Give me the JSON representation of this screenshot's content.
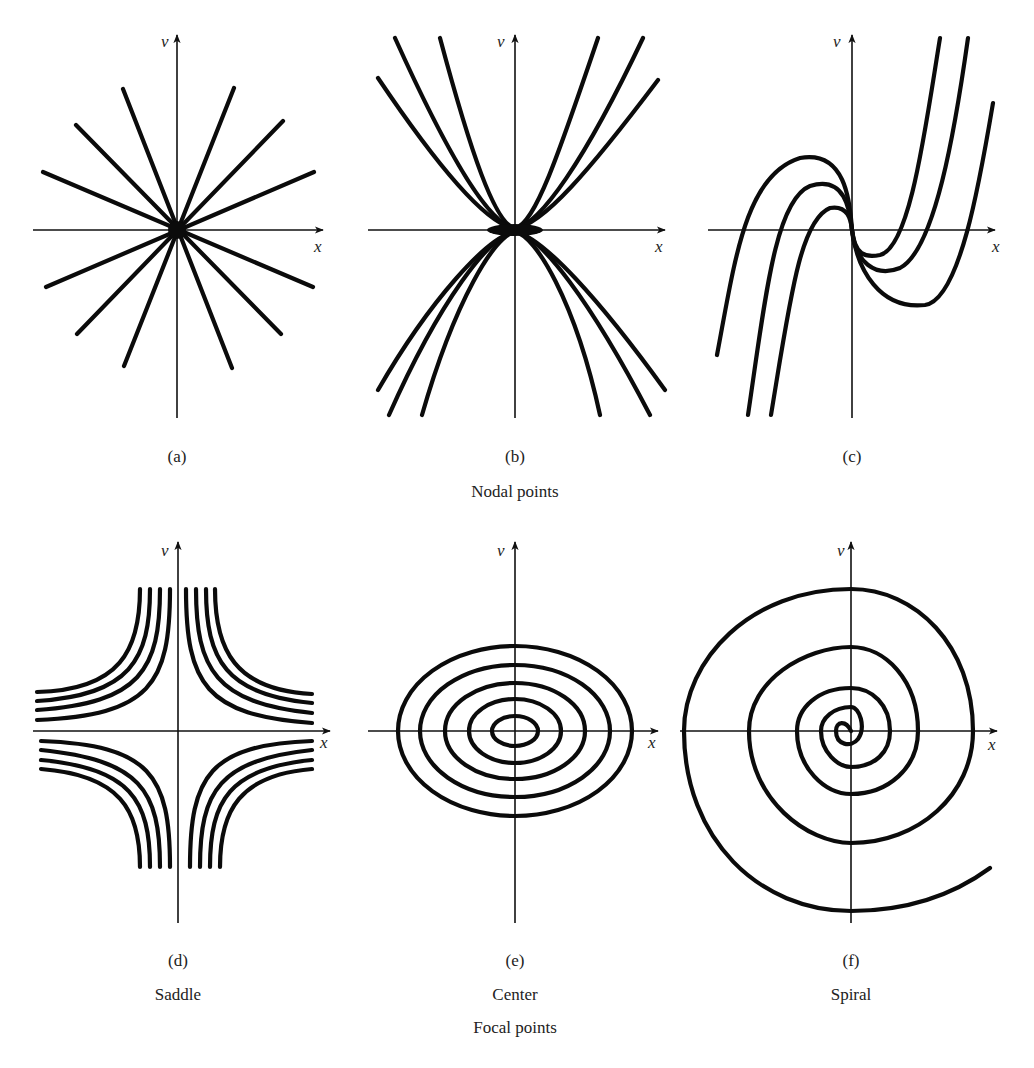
{
  "figure": {
    "groups": [
      {
        "caption": "Nodal points",
        "panels": [
          "a",
          "b",
          "c"
        ]
      },
      {
        "caption": "Focal points",
        "panels": [
          "d",
          "e",
          "f"
        ]
      }
    ],
    "panels": [
      {
        "id": "a",
        "label": "(a)",
        "name": "",
        "x_axis": "x",
        "y_axis": "v",
        "kind": "star node"
      },
      {
        "id": "b",
        "label": "(b)",
        "name": "",
        "x_axis": "x",
        "y_axis": "v",
        "kind": "parabolic node"
      },
      {
        "id": "c",
        "label": "(c)",
        "name": "",
        "x_axis": "x",
        "y_axis": "v",
        "kind": "cubic node"
      },
      {
        "id": "d",
        "label": "(d)",
        "name": "Saddle",
        "x_axis": "x",
        "y_axis": "v",
        "kind": "saddle"
      },
      {
        "id": "e",
        "label": "(e)",
        "name": "Center",
        "x_axis": "x",
        "y_axis": "v",
        "kind": "center"
      },
      {
        "id": "f",
        "label": "(f)",
        "name": "Spiral",
        "x_axis": "x",
        "y_axis": "v",
        "kind": "spiral"
      }
    ]
  },
  "colors": {
    "ink": "#0b0b0b",
    "background": "#ffffff"
  }
}
